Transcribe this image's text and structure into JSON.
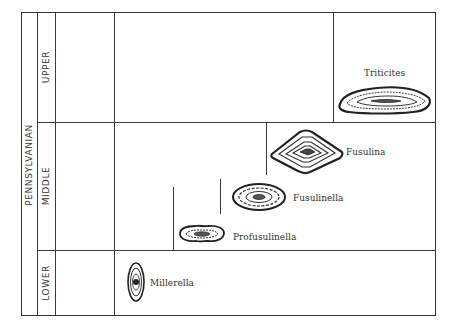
{
  "diagram": {
    "period": "PENNSYLVANIAN",
    "epochs": [
      {
        "name": "UPPER"
      },
      {
        "name": "MIDDLE"
      },
      {
        "name": "LOWER"
      }
    ],
    "fossils": [
      {
        "name": "Triticites",
        "epoch": "UPPER"
      },
      {
        "name": "Fusulina",
        "epoch": "MIDDLE"
      },
      {
        "name": "Fusulinella",
        "epoch": "MIDDLE"
      },
      {
        "name": "Profusulinella",
        "epoch": "MIDDLE"
      },
      {
        "name": "Millerella",
        "epoch": "LOWER"
      }
    ],
    "colors": {
      "ink": "#333333",
      "background": "#ffffff"
    }
  }
}
